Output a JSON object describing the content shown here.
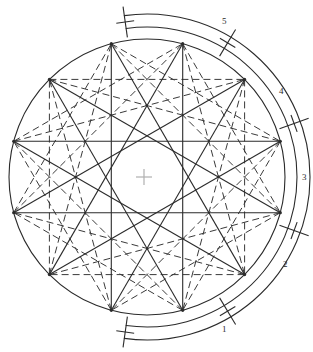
{
  "figure": {
    "type": "geometric-diagram",
    "canvas": {
      "width": 313,
      "height": 352
    },
    "colors": {
      "stroke": "#2b2b2b",
      "dashed_stroke": "#3a3a3a",
      "center_mark": "#b0b0b0",
      "background": "#ffffff"
    },
    "main_circle": {
      "center_x": 147,
      "center_y": 177,
      "radius": 138,
      "stroke_width": 1.1
    },
    "center_mark": {
      "cx": 144,
      "cy": 177,
      "arm": 8,
      "label": "center-cross"
    },
    "inner_circle_hint": {
      "cx": 147,
      "cy": 177,
      "radius": 36
    },
    "vertices": {
      "count": 12,
      "start_angle_deg": -75,
      "step_deg": 30,
      "radius": 138,
      "points": [
        {
          "id": 1,
          "angle_deg": -75,
          "x": 182.7,
          "y": 43.7
        },
        {
          "id": 2,
          "angle_deg": -45,
          "x": 244.6,
          "y": 79.4
        },
        {
          "id": 3,
          "angle_deg": -15,
          "x": 280.3,
          "y": 141.3
        },
        {
          "id": 4,
          "angle_deg": 15,
          "x": 280.3,
          "y": 212.7
        },
        {
          "id": 5,
          "angle_deg": 45,
          "x": 244.6,
          "y": 274.6
        },
        {
          "id": 6,
          "angle_deg": 75,
          "x": 182.7,
          "y": 310.3
        },
        {
          "id": 7,
          "angle_deg": 105,
          "x": 111.3,
          "y": 310.3
        },
        {
          "id": 8,
          "angle_deg": 135,
          "x": 49.4,
          "y": 274.6
        },
        {
          "id": 9,
          "angle_deg": 165,
          "x": 13.7,
          "y": 212.7
        },
        {
          "id": 10,
          "angle_deg": 195,
          "x": 13.7,
          "y": 141.3
        },
        {
          "id": 11,
          "angle_deg": 225,
          "x": 49.4,
          "y": 79.4
        },
        {
          "id": 12,
          "angle_deg": 255,
          "x": 111.3,
          "y": 43.7
        }
      ]
    },
    "chords": {
      "solid_star_step": 5,
      "solid_description": "{12/5} star polygon drawn with solid lines",
      "dashed_star_step": 4,
      "dashed_description": "{12/4} and {12/3} chord families drawn with dashed lines",
      "dashed_step_secondary": 3,
      "dash_pattern": "7,4"
    },
    "outer_arc": {
      "center_x": 147,
      "center_y": 177,
      "inner_radius": 150,
      "outer_radius": 163,
      "start_angle_deg": -98,
      "end_angle_deg": 98,
      "description": "graduated outer band with tick marks separating five numbered divisions"
    },
    "ticks": [
      {
        "angle_deg": -98,
        "label_for": "division-5-start"
      },
      {
        "angle_deg": -59,
        "label_for": "division-5-end"
      },
      {
        "angle_deg": -20,
        "label_for": "division-4-end"
      },
      {
        "angle_deg": 20,
        "label_for": "division-3-end"
      },
      {
        "angle_deg": 59,
        "label_for": "division-2-end"
      },
      {
        "angle_deg": 98,
        "label_for": "division-1-end"
      }
    ],
    "labels": [
      {
        "id": "label-5",
        "text": "5",
        "x": 222,
        "y": 17
      },
      {
        "id": "label-4",
        "text": "4",
        "x": 279,
        "y": 87
      },
      {
        "id": "label-3",
        "text": "3",
        "x": 302,
        "y": 173
      },
      {
        "id": "label-2",
        "text": "2",
        "x": 283,
        "y": 260
      },
      {
        "id": "label-1",
        "text": "1",
        "x": 222,
        "y": 325
      }
    ]
  },
  "chart_data": {
    "type": "diagram",
    "polygon_order": 12,
    "solid_star_schlafli": "{12/5}",
    "dashed_star_schlafli": "{12/4}",
    "divisions": [
      "1",
      "2",
      "3",
      "4",
      "5"
    ],
    "division_count": 5,
    "tick_count": 6
  }
}
